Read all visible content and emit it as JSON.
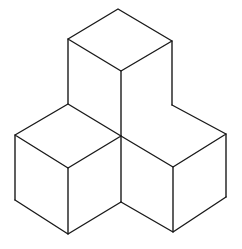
{
  "diagram": {
    "title": "",
    "stroke_color": "#1a1a1a",
    "background_color": "#ffffff",
    "cubes": [
      {
        "name": "top-cube",
        "position": "top"
      },
      {
        "name": "left-cube",
        "position": "bottom-left"
      },
      {
        "name": "right-cube",
        "position": "bottom-right"
      }
    ]
  }
}
